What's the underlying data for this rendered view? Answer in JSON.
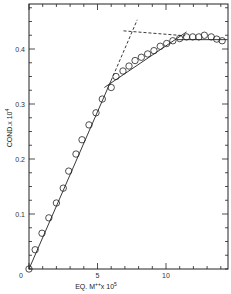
{
  "chart_data": {
    "type": "scatter",
    "title": "",
    "xlabel": "EQ. M++x 10^5",
    "xlabel_parts": {
      "base": "EQ. M",
      "sup1": "++",
      "mid": "x 10",
      "sup2": "5"
    },
    "ylabel": "COND.x 10^4",
    "ylabel_parts": {
      "base": "COND.x 10",
      "sup": "4"
    },
    "xlim": [
      0,
      14.5
    ],
    "ylim": [
      0,
      0.48
    ],
    "x_ticks": [
      0,
      5,
      10
    ],
    "x_tick_labels": [
      "0",
      "5",
      "10"
    ],
    "x_minor_step": 1,
    "y_ticks": [
      0.1,
      0.2,
      0.3,
      0.4
    ],
    "y_tick_labels": [
      "0.1",
      "0.2",
      "0.3",
      "0.4"
    ],
    "y_minor_step": 0.025,
    "grid": false,
    "legend": null,
    "series": [
      {
        "name": "conductance",
        "marker": "open-circle",
        "x": [
          0,
          0.45,
          0.95,
          1.45,
          2.0,
          2.5,
          2.9,
          3.43,
          3.87,
          4.38,
          4.89,
          5.35,
          6.0,
          6.35,
          6.86,
          7.3,
          7.74,
          8.2,
          8.66,
          9.12,
          9.58,
          10.05,
          10.5,
          11.0,
          11.5,
          11.95,
          12.4,
          12.8,
          13.3,
          13.7,
          14.1
        ],
        "y": [
          0.0,
          0.035,
          0.065,
          0.093,
          0.12,
          0.147,
          0.178,
          0.209,
          0.235,
          0.262,
          0.284,
          0.309,
          0.33,
          0.35,
          0.36,
          0.369,
          0.379,
          0.385,
          0.391,
          0.397,
          0.405,
          0.41,
          0.415,
          0.419,
          0.422,
          0.422,
          0.422,
          0.425,
          0.422,
          0.418,
          0.415
        ]
      }
    ],
    "fit_lines": [
      {
        "name": "initial-slope",
        "style": "solid",
        "x": [
          0,
          6.0
        ],
        "y": [
          0,
          0.343
        ]
      },
      {
        "name": "initial-slope-extension",
        "style": "dashed",
        "x": [
          6.0,
          7.9
        ],
        "y": [
          0.343,
          0.453
        ]
      },
      {
        "name": "second-slope",
        "style": "solid",
        "x": [
          5.5,
          11.5
        ],
        "y": [
          0.33,
          0.431
        ]
      },
      {
        "name": "plateau-extension",
        "style": "dashed",
        "x": [
          6.9,
          11.4
        ],
        "y": [
          0.433,
          0.424
        ]
      },
      {
        "name": "plateau",
        "style": "solid",
        "x": [
          10.8,
          14.5
        ],
        "y": [
          0.417,
          0.417
        ]
      }
    ]
  }
}
